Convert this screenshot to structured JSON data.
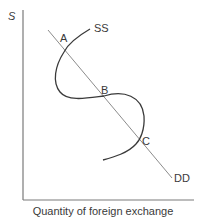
{
  "diagram": {
    "y_axis_label": "S",
    "x_axis_label": "Quantity of foreign exchange",
    "curves": {
      "supply": {
        "label": "SS",
        "shape": "backward-bending S-curve"
      },
      "demand": {
        "label": "DD",
        "shape": "downward-sloping straight line"
      }
    },
    "intersections": [
      {
        "label": "A"
      },
      {
        "label": "B"
      },
      {
        "label": "C"
      }
    ],
    "colors": {
      "axis": "#7a7a7a",
      "demand_line": "#8c8c8c",
      "supply_curve": "#3a3a3a",
      "text": "#3a3a3a"
    }
  }
}
